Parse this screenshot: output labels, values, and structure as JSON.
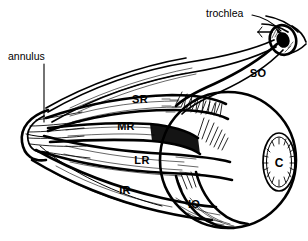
{
  "figure": {
    "background_color": "#ffffff",
    "ink_color": "#000000",
    "style": "black-and-white pen-and-ink line drawing with hatching"
  },
  "callouts": [
    {
      "id": "annulus",
      "label": "annulus",
      "description": "annulus of Zinn, common tendinous ring at the orbital apex",
      "text_x": 8,
      "text_y": 60,
      "leader": "vertical line from below the text down to the muscle-cone apex",
      "leader_from_x": 44,
      "leader_from_y": 64,
      "leader_to_x": 44,
      "leader_to_y": 122
    },
    {
      "id": "trochlea",
      "label": "trochlea",
      "description": "cartilaginous pulley through which the superior oblique tendon passes",
      "text_x": 206,
      "text_y": 17,
      "leader": "short curved line ending in a solid arrowhead aimed at the pulley",
      "leader_from_x": 252,
      "leader_from_y": 15,
      "leader_to_x": 283,
      "leader_to_y": 34
    }
  ],
  "muscle_labels": [
    {
      "id": "SR",
      "label": "SR",
      "name": "superior rectus",
      "x": 140,
      "y": 103
    },
    {
      "id": "MR",
      "label": "MR",
      "name": "medial rectus",
      "x": 126,
      "y": 130
    },
    {
      "id": "LR",
      "label": "LR",
      "name": "lateral rectus",
      "x": 142,
      "y": 164
    },
    {
      "id": "IR",
      "label": "IR",
      "name": "inferior rectus",
      "x": 125,
      "y": 194
    },
    {
      "id": "IO",
      "label": "IO",
      "name": "inferior oblique",
      "x": 194,
      "y": 208
    },
    {
      "id": "SO",
      "label": "SO",
      "name": "superior oblique",
      "x": 258,
      "y": 77
    }
  ],
  "structure_labels": [
    {
      "id": "C",
      "label": "C",
      "name": "cornea",
      "x": 279,
      "y": 162
    }
  ],
  "parts": {
    "globe": "large circle at right representing the eyeball",
    "cornea": "vertical ellipse on the right face of the globe with radiating hatch lines",
    "apex": "pointed rounded cone apex at left where all recti converge",
    "trochlea_pulley": "small dark ring near top-right through which the SO tendon loops"
  }
}
